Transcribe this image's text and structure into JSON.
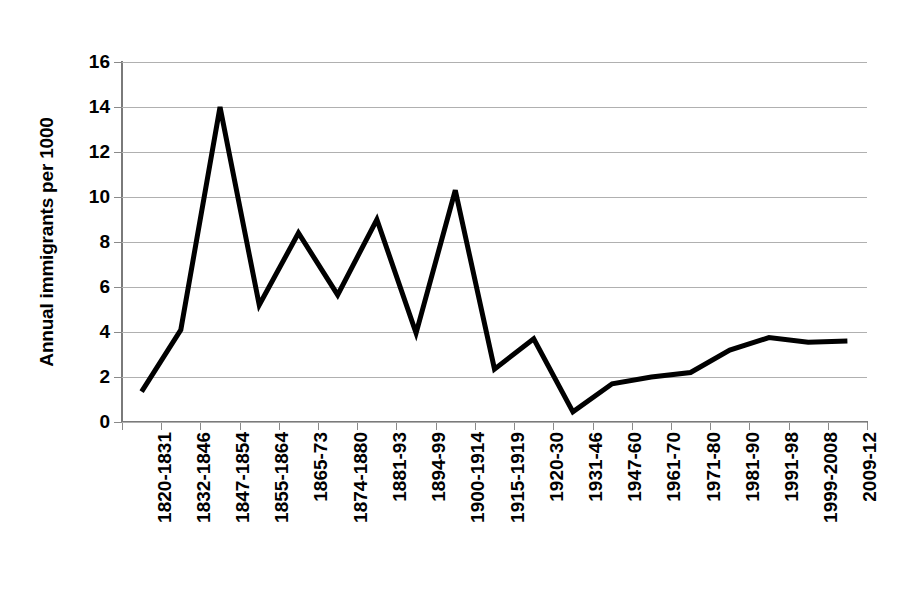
{
  "chart_data": {
    "type": "line",
    "title": "",
    "xlabel": "",
    "ylabel": "Annual immigrants per 1000",
    "ylim": [
      0,
      16
    ],
    "yticks": [
      0,
      2,
      4,
      6,
      8,
      10,
      12,
      14,
      16
    ],
    "grid": true,
    "legend": "none",
    "line_color": "#000000",
    "grid_color": "#b0b0b0",
    "axis_color": "#7a7a7a",
    "categories": [
      "1820-1831",
      "1832-1846",
      "1847-1854",
      "1855-1864",
      "1865-73",
      "1874-1880",
      "1881-93",
      "1894-99",
      "1900-1914",
      "1915-1919",
      "1920-30",
      "1931-46",
      "1947-60",
      "1961-70",
      "1971-80",
      "1981-90",
      "1991-98",
      "1999-2008",
      "2009-12"
    ],
    "values": [
      1.35,
      4.1,
      14.0,
      5.2,
      8.4,
      5.65,
      9.0,
      3.95,
      10.3,
      2.35,
      3.7,
      0.45,
      1.7,
      2.0,
      2.2,
      3.2,
      3.75,
      3.55,
      3.6
    ]
  }
}
